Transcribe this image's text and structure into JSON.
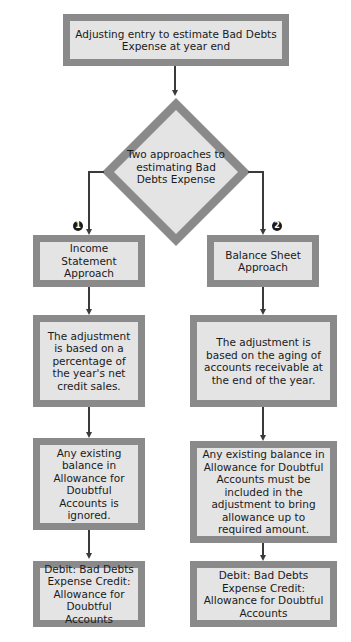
{
  "header_partial_text": "… adjusting entry … estimating Bad Debts Expense …",
  "diagram": {
    "start": {
      "text": "Adjusting entry to estimate Bad Debts Expense at year end"
    },
    "decision": {
      "text": "Two approaches to estimating Bad Debts Expense"
    },
    "branches": [
      {
        "badge": "1",
        "approach": "Income Statement Approach",
        "basis": "The adjustment is based on a percentage of the year's net credit sales.",
        "existing_balance": "Any existing balance in Allowance for Doubtful Accounts is ignored.",
        "entry": "Debit: Bad Debts Expense Credit: Allowance for Doubtful Accounts"
      },
      {
        "badge": "2",
        "approach": "Balance Sheet Approach",
        "basis": "The adjustment is based on the aging of accounts receivable at the end of the year.",
        "existing_balance": "Any existing balance in Allowance for Doubtful Accounts must be included in the adjustment to bring allowance up to required amount.",
        "entry": "Debit: Bad Debts Expense Credit: Allowance for Doubtful Accounts"
      }
    ],
    "colors": {
      "border": "#8a8a8a",
      "fill": "#e4e4e4",
      "connector": "#3a3a3a"
    }
  }
}
